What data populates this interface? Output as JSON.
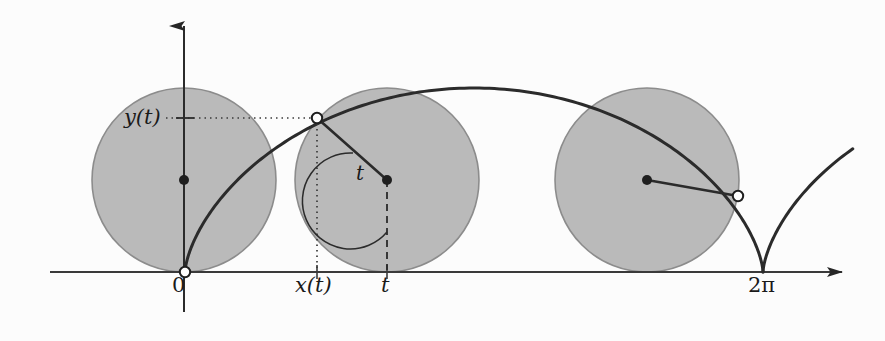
{
  "figure": {
    "kind": "cycloid-construction-diagram",
    "background_color": "#fcfcfc",
    "ink_color": "#262626",
    "circle_fill_color": "#b3b3b3",
    "circle_stroke_color": "#8a8a8a",
    "width": 885,
    "height": 341
  },
  "axes": {
    "x_axis": {
      "label_origin": "0",
      "arrow": "right",
      "y_pixel": 272,
      "start_x": 50,
      "end_x": 848
    },
    "y_axis": {
      "arrow": "up",
      "x_pixel": 184,
      "top_y": 18,
      "bottom_y": 312
    },
    "ticks": [
      {
        "name": "origin",
        "label": "0",
        "x": 185
      },
      {
        "name": "x-of-t",
        "label": "x(t)",
        "x": 317
      },
      {
        "name": "t",
        "label": "t",
        "x": 387
      },
      {
        "name": "two-pi",
        "label": "2π",
        "x": 763
      }
    ]
  },
  "labels": {
    "y_of_t": "y(t)",
    "x_of_t": "x(t)",
    "t_axis": "t",
    "t_angle": "t",
    "origin": "0",
    "two_pi": "2π"
  },
  "rolling_circles": [
    {
      "name": "circle-start",
      "center_x": 184,
      "center_y": 184,
      "radius": 90
    },
    {
      "name": "circle-middle",
      "center_x": 387,
      "center_y": 184,
      "radius": 90
    },
    {
      "name": "circle-end",
      "center_x": 647,
      "center_y": 184,
      "radius": 90
    }
  ],
  "marked_points": [
    {
      "name": "point-origin",
      "x": 185,
      "y": 272,
      "style": "open"
    },
    {
      "name": "point-on-middle-circle",
      "x": 317,
      "y": 118,
      "style": "open"
    },
    {
      "name": "point-on-end-circle",
      "x": 738,
      "y": 196,
      "style": "open"
    },
    {
      "name": "center-start",
      "x": 184,
      "y": 184,
      "style": "filled"
    },
    {
      "name": "center-middle",
      "x": 387,
      "y": 184,
      "style": "filled"
    },
    {
      "name": "center-end",
      "x": 647,
      "y": 184,
      "style": "filled"
    }
  ],
  "guides": {
    "horizontal_dotted": {
      "from_x": 165,
      "to_x": 317,
      "y": 118
    },
    "vertical_dotted": {
      "x": 317,
      "from_y": 118,
      "to_y": 272
    },
    "radius_dashed": {
      "x": 387,
      "from_y": 184,
      "to_y": 272
    },
    "angle_arc_label": "t"
  },
  "chart_data": {
    "type": "line",
    "title": "",
    "xlabel": "",
    "ylabel": "",
    "parametric": {
      "x": "r(t - sin t)",
      "y": "r(1 - cos t)",
      "t_range": [
        0,
        8.2
      ],
      "radius": 1
    },
    "annotations": [
      "0",
      "x(t)",
      "t",
      "2π",
      "y(t)"
    ]
  }
}
